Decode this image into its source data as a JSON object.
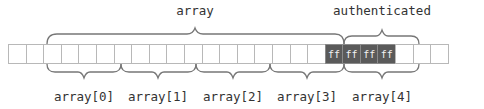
{
  "diagram": {
    "top_labels": [
      {
        "text": "array",
        "x": 195
      },
      {
        "text": "authenticated",
        "x": 382
      }
    ],
    "bottom_labels": [
      {
        "text": "array[0]",
        "x": 84
      },
      {
        "text": "array[1]",
        "x": 158
      },
      {
        "text": "array[2]",
        "x": 233
      },
      {
        "text": "array[3]",
        "x": 307
      },
      {
        "text": "array[4]",
        "x": 382
      }
    ],
    "cells": [
      "",
      "",
      "",
      "",
      "",
      "",
      "",
      "",
      "",
      "",
      "",
      "",
      "",
      "",
      "",
      "",
      "",
      "",
      "",
      "",
      "",
      "",
      "",
      "",
      ""
    ],
    "highlighted_cells": {
      "start_index": 18,
      "values": [
        "ff",
        "ff",
        "ff",
        "ff"
      ]
    },
    "colors": {
      "cell_border": "#b8b8b8",
      "highlight_fill": "#5a5a5a",
      "highlight_text": "#f2f2f2",
      "brace": "#777777",
      "text": "#333333"
    }
  }
}
